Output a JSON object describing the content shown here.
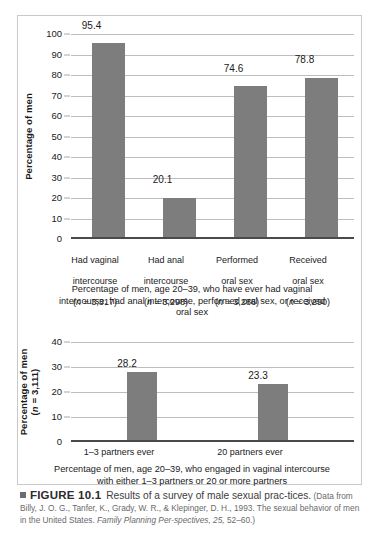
{
  "figure": {
    "label": "FIGURE 10.1",
    "lead": "Results of a survey of male sexual prac-tices.",
    "source": "(Data from Billy, J. O. G., Tanfer, K., Grady, W. R., & Klepinger, D. H., 1993. The sexual behavior of men in the United States. ",
    "source_italic": "Family Planning Per-spectives, 25,",
    "source_tail": " 52–60.)",
    "bullet_icon": "square-bullet-icon"
  },
  "chart_data": [
    {
      "type": "bar",
      "id": "top-chart",
      "title": "",
      "subtitle": "Percentage of men, age 20–39, who have ever had vaginal intercourse, had anal intercourse, performed oral sex, or received oral sex",
      "ylabel": "Percentage of men",
      "xlabel": "",
      "ylim": [
        0,
        100
      ],
      "yticks": [
        0,
        10,
        20,
        30,
        40,
        50,
        60,
        70,
        80,
        90,
        100
      ],
      "ytick_labels": [
        "0",
        "10",
        "20",
        "30",
        "40",
        "50",
        "60",
        "70",
        "80",
        "90",
        "100"
      ],
      "grid": true,
      "legend": "none",
      "bar_color": "#7d7d7d",
      "categories": [
        "Had vaginal\nintercourse\n(n = 3,317)",
        "Had anal\nintercourse\n(n = 3,298)",
        "Performed\noral sex\n(n = 3,286)",
        "Received\noral sex\n(n = 3,290)"
      ],
      "category_lines": [
        [
          "Had vaginal",
          "intercourse",
          "(n = 3,317)"
        ],
        [
          "Had anal",
          "intercourse",
          "(n = 3,298)"
        ],
        [
          "Performed",
          "oral sex",
          "(n = 3,286)"
        ],
        [
          "Received",
          "oral sex",
          "(n = 3,290)"
        ]
      ],
      "n_values": [
        3317,
        3298,
        3286,
        3290
      ],
      "values": [
        95.4,
        20.1,
        74.6,
        78.8
      ],
      "value_labels": [
        "95.4",
        "20.1",
        "74.6",
        "78.8"
      ]
    },
    {
      "type": "bar",
      "id": "bottom-chart",
      "title": "",
      "subtitle": "Percentage of men, age 20–39, who engaged in vaginal intercourse with either 1–3 partners or 20 or more partners",
      "ylabel": "Percentage of men",
      "ylabel_line2": "(n = 3,111)",
      "ylabel_n": 3111,
      "xlabel": "",
      "ylim": [
        0,
        40
      ],
      "yticks": [
        0,
        10,
        20,
        30,
        40
      ],
      "ytick_labels": [
        "0",
        "10",
        "20",
        "30",
        "40"
      ],
      "grid": true,
      "legend": "none",
      "bar_color": "#7d7d7d",
      "categories": [
        "1–3 partners ever",
        "20 partners ever"
      ],
      "values": [
        28.2,
        23.3
      ],
      "value_labels": [
        "28.2",
        "23.3"
      ]
    }
  ]
}
